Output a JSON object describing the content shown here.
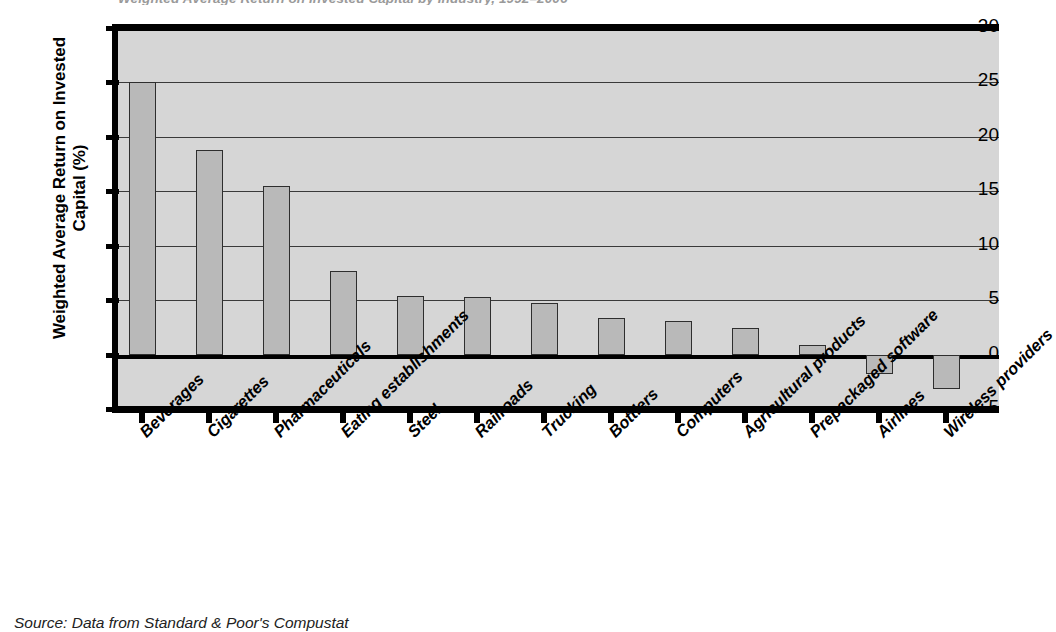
{
  "figure": {
    "title_sliver": "Weighted Average Return on Invested Capital by Industry, 1992–2006",
    "source": "Source: Data from Standard & Poor's Compustat",
    "colors": {
      "plot_background": "#d6d6d6",
      "bar_fill": "#b9b9b9",
      "bar_border": "#2e2e2e",
      "axis": "#000000",
      "gridline": "#3a3a3a"
    }
  },
  "chart_data": {
    "type": "bar",
    "title": "Weighted Average Return on Invested Capital by Industry, 1992–2006",
    "xlabel": "",
    "ylabel": "Weighted Average Return on Invested Capital (%)",
    "ylim": [
      -5,
      30
    ],
    "yticks": [
      30,
      25,
      20,
      15,
      10,
      5,
      0,
      -5
    ],
    "ytick_labels": [
      "30",
      "25",
      "20",
      "15",
      "10",
      "5",
      "0",
      "−5"
    ],
    "grid": true,
    "legend": "none",
    "categories": [
      "Beverages",
      "Cigarettes",
      "Pharmaceuticals",
      "Eating establishments",
      "Steel",
      "Railroads",
      "Trucking",
      "Bottlers",
      "Computers",
      "Agricultural products",
      "Prepackaged software",
      "Airlines",
      "Wireless providers"
    ],
    "values": [
      25.0,
      18.8,
      15.5,
      7.7,
      5.4,
      5.3,
      4.7,
      3.4,
      3.1,
      2.4,
      0.9,
      -1.8,
      -3.2
    ],
    "units": "%"
  }
}
